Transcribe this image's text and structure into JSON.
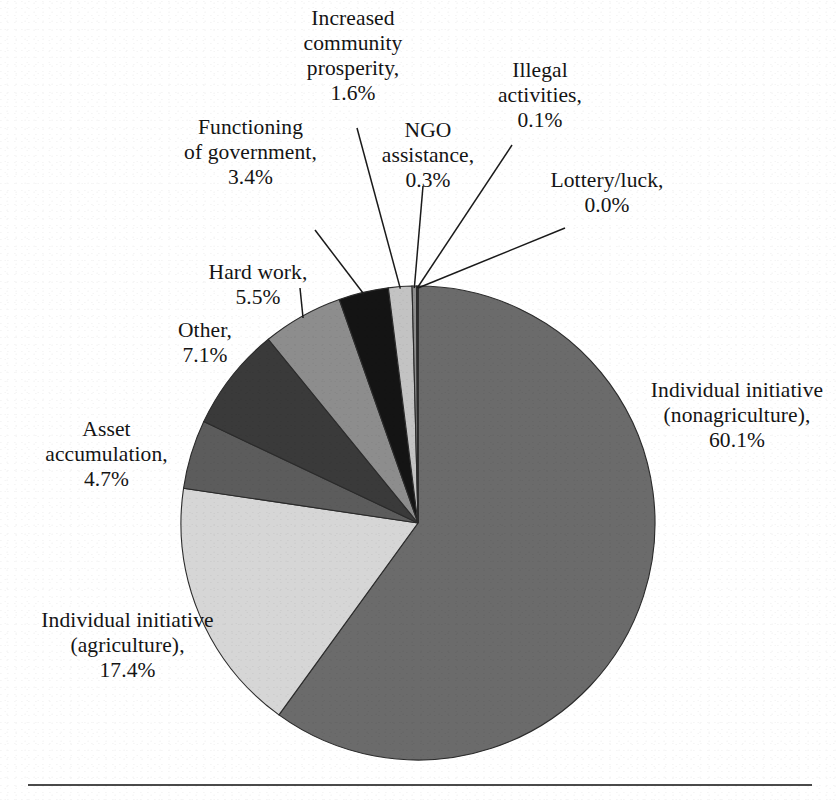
{
  "figure": {
    "background_color": "#ffffff",
    "text_color": "#141414",
    "rule_color": "#4a4a4a",
    "has_bottom_rule": true
  },
  "chart_data": {
    "type": "pie",
    "title": "",
    "subtitle": "",
    "xlabel": "",
    "ylabel": "",
    "legend_position": "none",
    "grid": false,
    "labels_show_percent": true,
    "start_angle_deg": 0,
    "direction": "clockwise",
    "center": {
      "x": 418,
      "y": 523
    },
    "radius": 237,
    "categories": [
      "Individual initiative (nonagriculture)",
      "Individual initiative (agriculture)",
      "Asset accumulation",
      "Other",
      "Hard work",
      "Functioning of government",
      "Increased community prosperity",
      "NGO assistance",
      "Illegal activities",
      "Lottery/luck"
    ],
    "values": [
      60.1,
      17.4,
      4.7,
      7.1,
      5.5,
      3.4,
      1.6,
      0.3,
      0.1,
      0.0
    ],
    "colors": [
      "#6b6b6b",
      "#d6d6d6",
      "#5c5c5c",
      "#3a3a3a",
      "#8d8d8d",
      "#141414",
      "#c3c3c3",
      "#8d8d8d",
      "#3a3a3a",
      "#d6d6d6"
    ],
    "slices": [
      {
        "label": "Individual initiative (nonagriculture)",
        "value": 60.1,
        "display": "60.1%",
        "color": "#6b6b6b"
      },
      {
        "label": "Individual initiative (agriculture)",
        "value": 17.4,
        "display": "17.4%",
        "color": "#d6d6d6"
      },
      {
        "label": "Asset accumulation",
        "value": 4.7,
        "display": "4.7%",
        "color": "#5c5c5c"
      },
      {
        "label": "Other",
        "value": 7.1,
        "display": "7.1%",
        "color": "#3a3a3a"
      },
      {
        "label": "Hard work",
        "value": 5.5,
        "display": "5.5%",
        "color": "#8d8d8d"
      },
      {
        "label": "Functioning of government",
        "value": 3.4,
        "display": "3.4%",
        "color": "#141414"
      },
      {
        "label": "Increased community prosperity",
        "value": 1.6,
        "display": "1.6%",
        "color": "#c3c3c3"
      },
      {
        "label": "NGO assistance",
        "value": 0.3,
        "display": "0.3%",
        "color": "#8d8d8d"
      },
      {
        "label": "Illegal activities",
        "value": 0.1,
        "display": "0.1%",
        "color": "#3a3a3a"
      },
      {
        "label": "Lottery/luck",
        "value": 0.0,
        "display": "0.0%",
        "color": "#d6d6d6"
      }
    ]
  },
  "labels": {
    "increased_community_prosperity": "Increased\ncommunity\nprosperity,\n1.6%",
    "illegal_activities": "Illegal\nactivities,\n0.1%",
    "functioning_of_government": "Functioning\nof government,\n3.4%",
    "ngo_assistance": "NGO\nassistance,\n0.3%",
    "lottery_luck": "Lottery/luck,\n0.0%",
    "hard_work": "Hard work,\n5.5%",
    "other": "Other,\n7.1%",
    "asset_accumulation": "Asset\naccumulation,\n4.7%",
    "individual_initiative_agriculture": "Individual initiative\n(agriculture),\n17.4%",
    "individual_initiative_nonagriculture": "Individual initiative\n(nonagriculture),\n60.1%"
  }
}
